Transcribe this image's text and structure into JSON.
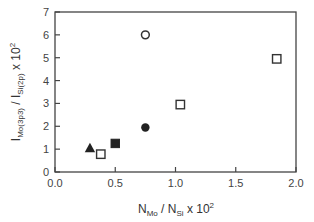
{
  "chart_data": {
    "type": "scatter",
    "title": "",
    "xlabel": "N_Mo / N_Si x 10^2",
    "ylabel": "I_Mo(3p3) / I_Si(2p) x 10^2",
    "xlabel_parts": {
      "main1": "N",
      "sub1": "Mo",
      "mid": " / N",
      "sub2": "Si",
      "tail": " x 10",
      "sup": "2"
    },
    "ylabel_parts": {
      "main1": "I",
      "sub1": "Mo(3p3)",
      "mid": " / I",
      "sub2": "Si(2p)",
      "tail": " x 10",
      "sup": "2"
    },
    "xlim": [
      0,
      2.0
    ],
    "ylim": [
      0,
      7
    ],
    "xticks": [
      "0.0",
      "0.5",
      "1.0",
      "1.5",
      "2.0"
    ],
    "yticks": [
      "0",
      "1",
      "2",
      "3",
      "4",
      "5",
      "6",
      "7"
    ],
    "grid": false,
    "legend": null,
    "series": [
      {
        "name": "open-square",
        "marker": "square-open",
        "points": [
          [
            0.38,
            0.78
          ],
          [
            1.04,
            2.95
          ],
          [
            1.84,
            4.95
          ]
        ]
      },
      {
        "name": "filled-square",
        "marker": "square-filled",
        "points": [
          [
            0.5,
            1.25
          ]
        ]
      },
      {
        "name": "filled-triangle",
        "marker": "triangle-filled",
        "points": [
          [
            0.29,
            1.05
          ]
        ]
      },
      {
        "name": "open-circle",
        "marker": "circle-open",
        "points": [
          [
            0.75,
            6.0
          ]
        ]
      },
      {
        "name": "filled-circle",
        "marker": "circle-filled",
        "points": [
          [
            0.75,
            1.95
          ]
        ]
      }
    ]
  }
}
